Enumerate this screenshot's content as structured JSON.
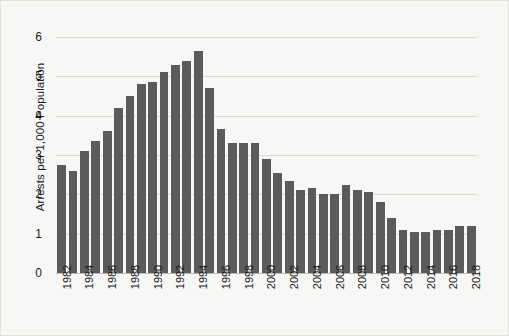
{
  "chart_data": {
    "type": "bar",
    "title": "",
    "subtitle": "",
    "xlabel": "",
    "ylabel": "Arrests per 1,000 Population",
    "ylim": [
      0,
      6
    ],
    "yticks": [
      "0",
      "1",
      "2",
      "3",
      "4",
      "5",
      "6"
    ],
    "ytick_values": [
      0,
      1,
      2,
      3,
      4,
      5,
      6
    ],
    "grid": "horizontal",
    "legend": "none",
    "bar_color": "#5b5b5b",
    "categories": [
      "1982",
      "1983",
      "1984",
      "1985",
      "1986",
      "1987",
      "1988",
      "1989",
      "1990",
      "1991",
      "1992",
      "1993",
      "1994",
      "1995",
      "1996",
      "1997",
      "1998",
      "1999",
      "2000",
      "2001",
      "2002",
      "2003",
      "2004",
      "2005",
      "2006",
      "2007",
      "2008",
      "2009",
      "2010",
      "2011",
      "2012",
      "2013",
      "2014",
      "2015",
      "2016",
      "2017",
      "2018"
    ],
    "xtick_labels_shown": [
      "1982",
      "1984",
      "1986",
      "1988",
      "1990",
      "1992",
      "1994",
      "1996",
      "1998",
      "2000",
      "2002",
      "2004",
      "2006",
      "2008",
      "2010",
      "2012",
      "2014",
      "2016",
      "2018"
    ],
    "values": [
      2.75,
      2.6,
      3.1,
      3.35,
      3.6,
      4.2,
      4.5,
      4.8,
      4.85,
      5.1,
      5.3,
      5.4,
      5.65,
      4.7,
      3.65,
      3.3,
      3.3,
      3.3,
      2.9,
      2.55,
      2.35,
      2.1,
      2.15,
      2.0,
      2.0,
      2.25,
      2.1,
      2.05,
      1.8,
      1.4,
      1.1,
      1.05,
      1.05,
      1.1,
      1.1,
      1.2,
      1.2
    ]
  }
}
